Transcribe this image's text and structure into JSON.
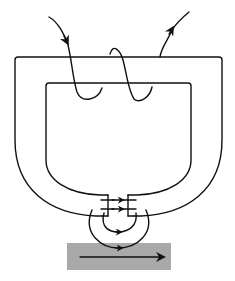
{
  "diagram": {
    "type": "magnetic-recording-head",
    "components": {
      "core": {
        "shape": "U-shaped ring with gap at bottom"
      },
      "coil": {
        "turns": 2,
        "lead_in_arrow": "downward into core",
        "lead_out_arrow": "upward away from core"
      },
      "gap_flux": {
        "arrows": 2,
        "direction": "right"
      },
      "fringing_field": {
        "loops": 2,
        "direction": "right"
      },
      "medium": {
        "color": "#a9a9a9",
        "motion_arrow_direction": "right"
      }
    },
    "colors": {
      "line": "#111111",
      "medium": "#a9a9a9",
      "background": "#ffffff"
    }
  }
}
